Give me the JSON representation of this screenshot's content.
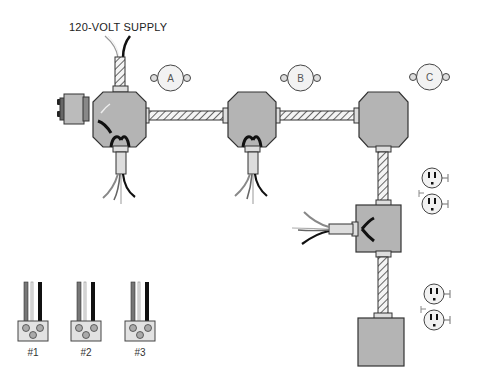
{
  "diagram": {
    "supply_label": "120-VOLT SUPPLY",
    "fixtures": [
      {
        "id": "A",
        "label": "A"
      },
      {
        "id": "B",
        "label": "B"
      },
      {
        "id": "C",
        "label": "C"
      }
    ],
    "switch_connectors": [
      {
        "label": "#1"
      },
      {
        "label": "#2"
      },
      {
        "label": "#3"
      }
    ],
    "components": {
      "junction_boxes": [
        "box-a",
        "box-b",
        "box-c"
      ],
      "square_boxes": [
        "receptacle-box-1",
        "receptacle-box-2"
      ],
      "duplex_receptacles": 2,
      "conduit_runs": 4
    },
    "colors": {
      "box_fill": "#b4b4b4",
      "box_stroke": "#333333",
      "fixture_fill": "#f2f2f2",
      "black_wire": "#111111",
      "gray_wire": "#777777",
      "white_wire": "#e8e8e8"
    }
  }
}
